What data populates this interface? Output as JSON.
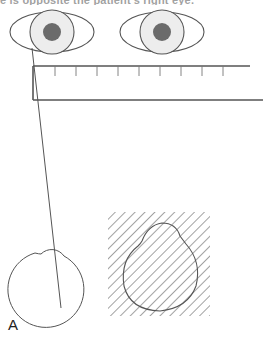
{
  "caption_fragment": "e is opposite the patient's right eye.",
  "panel_label": "A",
  "colors": {
    "stroke": "#555555",
    "iris_fill": "#ededed",
    "pupil_fill": "#6b6b6b",
    "hatch": "#8a8a8a"
  },
  "figure": {
    "eyes": [
      {
        "name": "left-eye",
        "cx": 52,
        "cy": 32,
        "rx": 42,
        "ry": 20,
        "iris_r": 22,
        "pupil_r": 9
      },
      {
        "name": "right-eye",
        "cx": 162,
        "cy": 32,
        "rx": 42,
        "ry": 20,
        "iris_r": 22,
        "pupil_r": 9
      }
    ],
    "ruler": {
      "top_y": 66,
      "bottom_y": 100,
      "left_x": 33,
      "top_right_x": 250,
      "bottom_right_x": 263,
      "tick_xs": [
        55,
        76,
        97,
        118,
        139,
        160,
        181,
        202,
        223
      ],
      "tick_len": 10
    },
    "sight_line": {
      "x1": 32,
      "y1": 48,
      "x2": 61,
      "y2": 308
    },
    "outline_shape": {
      "cx": 50,
      "cy": 284,
      "r": 38,
      "bump_cx": 49,
      "bump_cy": 262,
      "bump_r": 15
    },
    "hatched_panel": {
      "x": 108,
      "y": 212,
      "w": 102,
      "h": 104,
      "shape_cx": 158,
      "shape_cy": 274,
      "shape_r": 36
    }
  }
}
